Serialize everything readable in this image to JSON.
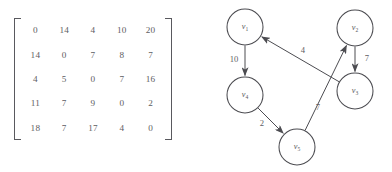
{
  "figure": {
    "caption": "",
    "background_color": "#ffffff",
    "ink_color": "#4c4c51",
    "text_color": "#5d5d62"
  },
  "matrix": {
    "name": "adjacency-matrix",
    "rows": 5,
    "cols": 5,
    "left_bracket": "[",
    "right_bracket": "]",
    "values": [
      [
        "0",
        "14",
        "4",
        "10",
        "20"
      ],
      [
        "14",
        "0",
        "7",
        "8",
        "7"
      ],
      [
        "4",
        "5",
        "0",
        "7",
        "16"
      ],
      [
        "11",
        "7",
        "9",
        "0",
        "2"
      ],
      [
        "18",
        "7",
        "17",
        "4",
        "0"
      ]
    ]
  },
  "graph": {
    "name": "weighted-directed-graph",
    "node_radius": 18,
    "nodes": [
      {
        "id": "v1",
        "label": "v",
        "sub": "1",
        "cx": 55,
        "cy": 27
      },
      {
        "id": "v2",
        "label": "v",
        "sub": "2",
        "cx": 165,
        "cy": 28
      },
      {
        "id": "v3",
        "label": "v",
        "sub": "3",
        "cx": 165,
        "cy": 91
      },
      {
        "id": "v4",
        "label": "v",
        "sub": "4",
        "cx": 55,
        "cy": 95
      },
      {
        "id": "v5",
        "label": "v",
        "sub": "5",
        "cx": 107,
        "cy": 147
      }
    ],
    "edges": [
      {
        "id": "e-v1-v4",
        "from": "v1",
        "to": "v4",
        "weight": "10",
        "label_x": 44,
        "label_y": 60
      },
      {
        "id": "e-v3-v1",
        "from": "v3",
        "to": "v1",
        "weight": "4",
        "label_x": 113,
        "label_y": 51
      },
      {
        "id": "e-v2-v3",
        "from": "v2",
        "to": "v3",
        "weight": "7",
        "label_x": 177,
        "label_y": 59
      },
      {
        "id": "e-v5-v2",
        "from": "v5",
        "to": "v2",
        "weight": "7",
        "label_x": 128,
        "label_y": 108
      },
      {
        "id": "e-v4-v5",
        "from": "v4",
        "to": "v5",
        "weight": "2",
        "label_x": 72,
        "label_y": 124
      }
    ]
  },
  "chart_data": {
    "type": "diagram",
    "title": "",
    "subtype": "adjacency-matrix-and-directed-weighted-graph",
    "matrix": {
      "labels_rows": [
        "v1",
        "v2",
        "v3",
        "v4",
        "v5"
      ],
      "labels_cols": [
        "v1",
        "v2",
        "v3",
        "v4",
        "v5"
      ],
      "data": [
        [
          0,
          14,
          4,
          10,
          20
        ],
        [
          14,
          0,
          7,
          8,
          7
        ],
        [
          4,
          5,
          0,
          7,
          16
        ],
        [
          11,
          7,
          9,
          0,
          2
        ],
        [
          18,
          7,
          17,
          4,
          0
        ]
      ]
    },
    "graph": {
      "directed": true,
      "weighted": true,
      "vertices": [
        "v1",
        "v2",
        "v3",
        "v4",
        "v5"
      ],
      "edges": [
        {
          "source": "v1",
          "target": "v4",
          "weight": 10
        },
        {
          "source": "v3",
          "target": "v1",
          "weight": 4
        },
        {
          "source": "v2",
          "target": "v3",
          "weight": 7
        },
        {
          "source": "v5",
          "target": "v2",
          "weight": 7
        },
        {
          "source": "v4",
          "target": "v5",
          "weight": 2
        }
      ]
    }
  }
}
